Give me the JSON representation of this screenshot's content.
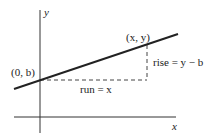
{
  "diagram": {
    "axes": {
      "x_label": "x",
      "y_label": "y"
    },
    "points": {
      "intercept": {
        "label": "(0, b)"
      },
      "general": {
        "label": "(x, y)"
      }
    },
    "annotations": {
      "rise": "rise = y − b",
      "run": "run = x"
    },
    "colors": {
      "line": "#222222",
      "axis": "#333333",
      "dash": "#444444"
    }
  }
}
